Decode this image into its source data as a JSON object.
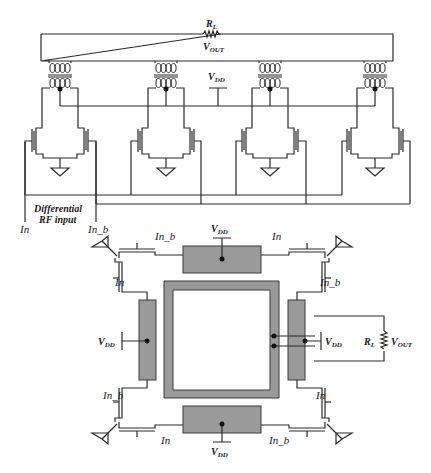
{
  "top_schematic": {
    "load": {
      "name": "R",
      "sub": "L"
    },
    "output": {
      "name": "V",
      "sub": "OUT"
    },
    "supply": {
      "name": "V",
      "sub": "DD"
    },
    "input_label_line1": "Differential",
    "input_label_line2": "RF input",
    "input_pos": "In",
    "input_neg": "In_b",
    "stages": 4
  },
  "bottom_layout": {
    "supply": {
      "name": "V",
      "sub": "DD"
    },
    "load": {
      "name": "R",
      "sub": "L"
    },
    "output": {
      "name": "V",
      "sub": "OUT"
    },
    "labels": {
      "top_left_h": "In_b",
      "top_right_h": "In",
      "left_top_v": "In",
      "right_top_v": "In_b",
      "left_bottom_v": "In_b",
      "right_bottom_v": "In",
      "bottom_left_h": "In",
      "bottom_right_h": "In_b"
    }
  },
  "colors": {
    "wire": "#2a2a2a",
    "metal": "#9a9a9a",
    "background": "#ffffff"
  }
}
